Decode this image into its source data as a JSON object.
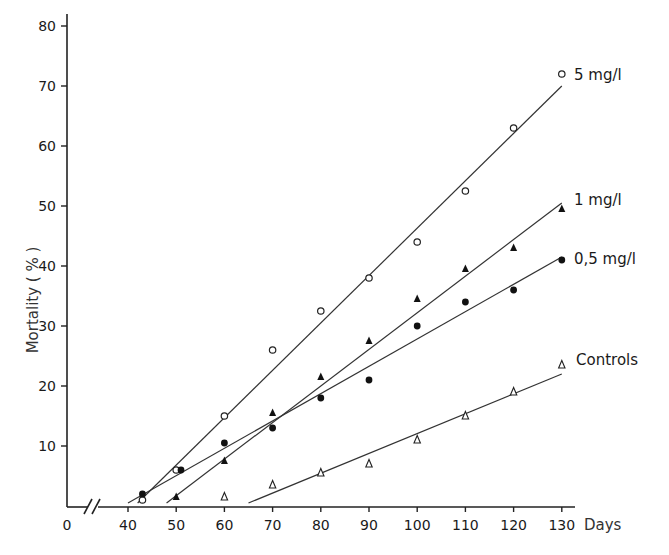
{
  "chart_data": {
    "type": "scatter",
    "title": "",
    "xlabel": "Days",
    "ylabel": "Mortality ( % )",
    "xlim": [
      0,
      130
    ],
    "ylim": [
      0,
      80
    ],
    "x_axis_break": "between 0 and 40",
    "x_ticks": [
      0,
      40,
      50,
      60,
      70,
      80,
      90,
      100,
      110,
      120,
      130
    ],
    "y_ticks": [
      10,
      20,
      30,
      40,
      50,
      60,
      70,
      80
    ],
    "grid": false,
    "legend": "inline labels at right end of each regression line",
    "series": [
      {
        "name": "5 mg/l",
        "marker": "open-circle",
        "x": [
          43,
          50,
          60,
          70,
          80,
          90,
          100,
          110,
          120,
          130
        ],
        "y": [
          1,
          6,
          15,
          26,
          32.5,
          38,
          44,
          52.5,
          63,
          72
        ],
        "fit_line": {
          "x": [
            42,
            130
          ],
          "y": [
            0.5,
            70
          ]
        }
      },
      {
        "name": "1 mg/l",
        "marker": "filled-triangle",
        "x": [
          50,
          60,
          70,
          80,
          90,
          100,
          110,
          120,
          130
        ],
        "y": [
          1.5,
          7.5,
          15.5,
          21.5,
          27.5,
          34.5,
          39.5,
          43,
          49.5
        ],
        "fit_line": {
          "x": [
            48,
            130
          ],
          "y": [
            0.5,
            50.5
          ]
        }
      },
      {
        "name": "0,5 mg/l",
        "marker": "filled-circle",
        "x": [
          43,
          51,
          60,
          70,
          80,
          90,
          100,
          110,
          120,
          130
        ],
        "y": [
          2,
          6,
          10.5,
          13,
          18,
          21,
          30,
          34,
          36,
          41
        ],
        "fit_line": {
          "x": [
            40,
            130
          ],
          "y": [
            0.5,
            41.5
          ]
        }
      },
      {
        "name": "Controls",
        "marker": "open-triangle",
        "x": [
          60,
          70,
          80,
          90,
          100,
          110,
          120,
          130
        ],
        "y": [
          1.5,
          3.5,
          5.5,
          7,
          11,
          15,
          19,
          23.5
        ],
        "fit_line": {
          "x": [
            65,
            130
          ],
          "y": [
            0.5,
            22
          ]
        }
      }
    ]
  },
  "axes": {
    "x_title": "Days",
    "y_title": "Mortality ( % )",
    "x_tick_labels": [
      "0",
      "40",
      "50",
      "60",
      "70",
      "80",
      "90",
      "100",
      "110",
      "120",
      "130"
    ],
    "y_tick_labels": [
      "10",
      "20",
      "30",
      "40",
      "50",
      "60",
      "70",
      "80"
    ]
  },
  "labels": {
    "s5": "5 mg/l",
    "s1": "1 mg/l",
    "s05": "0,5 mg/l",
    "ctrl": "Controls"
  }
}
